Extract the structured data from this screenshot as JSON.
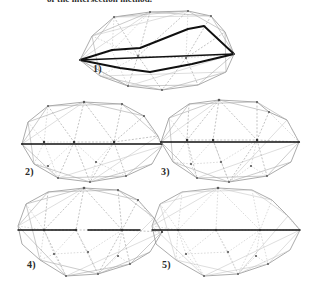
{
  "figure": {
    "caption_top": "of the intersection method.",
    "background_color": "#ffffff",
    "ink_color": "#101010",
    "mesh_color": "#a8a8a8",
    "panel_count": 5,
    "layout": "1 panel on first row, 2 panels on second row, 2 panels on third row"
  },
  "panels": [
    {
      "label": "1)",
      "name": "triangulated-polygon-with-highlighted-cut-outline",
      "description": "Triangulated irregular polygon mesh with a bold closed lens-shaped polyline drawn across it",
      "has_bold_outline": true,
      "has_horizontal_cut_line": true
    },
    {
      "label": "2)",
      "name": "triangulated-polygon-with-horizontal-cut",
      "description": "Triangulated irregular polygon mesh crossed by a bold horizontal line",
      "has_bold_outline": false,
      "has_horizontal_cut_line": true
    },
    {
      "label": "3)",
      "name": "triangulated-polygon-with-horizontal-cut-variant",
      "description": "Triangulated irregular polygon mesh crossed by a bold horizontal line, denser upper triangles",
      "has_bold_outline": false,
      "has_horizontal_cut_line": true
    },
    {
      "label": "4)",
      "name": "triangulated-polygon-with-partial-cut",
      "description": "Triangulated irregular polygon mesh with a partially drawn bold horizontal line",
      "has_bold_outline": false,
      "has_horizontal_cut_line": true
    },
    {
      "label": "5)",
      "name": "triangulated-polygon-faint-mesh",
      "description": "Triangulated irregular polygon mesh drawn in lighter strokes with a horizontal line",
      "has_bold_outline": false,
      "has_horizontal_cut_line": true
    }
  ]
}
